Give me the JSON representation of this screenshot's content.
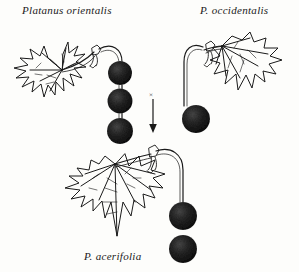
{
  "figure": {
    "title_left": "Platanus orientalis",
    "title_right": "P. occidentalis",
    "title_bottom": "P. acerifolia",
    "cross_symbol": "×",
    "ink_color": "#1a1a1a",
    "fruit_color": "#171717",
    "background_color": "#fdfdfb"
  },
  "specimens": [
    {
      "name": "platanus-orientalis",
      "label": "Platanus orientalis",
      "role": "parent",
      "leaf_description": "deeply-lobed-palmate-leaf",
      "fruit_ball_count": 3,
      "fruit_positions_y": [
        73,
        101,
        131
      ],
      "peduncle_side": "right"
    },
    {
      "name": "platanus-occidentalis",
      "label": "P. occidentalis",
      "role": "parent",
      "leaf_description": "broad-shallow-lobed-leaf",
      "fruit_ball_count": 1,
      "fruit_positions_y": [
        119
      ],
      "peduncle_side": "left"
    },
    {
      "name": "platanus-acerifolia",
      "label": "P. acerifolia",
      "role": "hybrid",
      "leaf_description": "intermediate-toothed-lobed-leaf",
      "fruit_ball_count": 2,
      "fruit_positions_y": [
        215,
        248
      ],
      "peduncle_side": "right"
    }
  ],
  "cross": {
    "symbol": "×",
    "arrow_direction": "down",
    "meaning": "hybrid-cross"
  }
}
